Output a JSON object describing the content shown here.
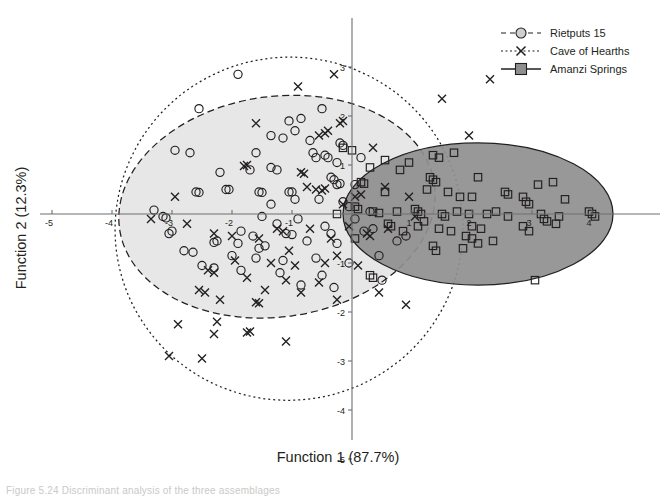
{
  "figure": {
    "type": "scatter",
    "background": "#ffffff"
  },
  "axes": {
    "xlabel": "Function 1 (87.7%)",
    "ylabel": "Function 2 (12.3%)",
    "xticks": [
      "-5",
      "-4",
      "-3",
      "-2",
      "-1",
      "1",
      "2",
      "3",
      "4"
    ],
    "yticks": [
      "3",
      "2",
      "1",
      "-1",
      "-2",
      "-3",
      "-4",
      "-5"
    ],
    "xlim": [
      -5.1,
      5.0
    ],
    "ylim": [
      -5.0,
      3.6
    ],
    "grid": false
  },
  "legend": {
    "position": "top-right",
    "items": [
      {
        "label": "Rietputs 15",
        "marker": "circle",
        "line": "dashed",
        "fill": "#cfcfcf"
      },
      {
        "label": "Cave of Hearths",
        "marker": "x",
        "line": "dotted",
        "fill": "none"
      },
      {
        "label": "Amanzi Springs",
        "marker": "square",
        "line": "solid",
        "fill": "#8f8f8f"
      }
    ]
  },
  "colors": {
    "ellipse_rietputs_fill": "#e3e3e3",
    "ellipse_hearths_fill": "#e3e3e3",
    "ellipse_amanzi_fill": "#8f8f8f",
    "stroke": "#231f20",
    "axis": "#6d6e71"
  },
  "chart_data": {
    "type": "scatter",
    "title": "",
    "xlabel": "Function 1 (87.7%)",
    "ylabel": "Function 2 (12.3%)",
    "xlim": [
      -5.1,
      5.0
    ],
    "ylim": [
      -5.0,
      3.6
    ],
    "grid": false,
    "legend_position": "top-right",
    "series": [
      {
        "name": "Rietputs 15",
        "marker": "circle",
        "line_style": "dashed",
        "ellipse": {
          "cx": -1.25,
          "cy": 0.15,
          "rx": 2.65,
          "ry": 2.25,
          "rotation": -8,
          "fill": "#e3e3e3",
          "stroke": "#231f20",
          "dash": "7,4"
        },
        "points": [
          [
            -1.9,
            2.85
          ],
          [
            -2.55,
            2.15
          ],
          [
            -1.05,
            1.9
          ],
          [
            -0.85,
            1.95
          ],
          [
            -1.35,
            1.6
          ],
          [
            -1.15,
            1.55
          ],
          [
            -0.7,
            1.5
          ],
          [
            -2.95,
            1.3
          ],
          [
            -2.7,
            1.25
          ],
          [
            -0.6,
            1.15
          ],
          [
            -1.6,
            1.25
          ],
          [
            -0.25,
            1.05
          ],
          [
            -0.35,
            0.75
          ],
          [
            -0.3,
            0.7
          ],
          [
            -0.25,
            0.6
          ],
          [
            -0.2,
            0.62
          ],
          [
            -1.0,
            0.45
          ],
          [
            -1.05,
            0.45
          ],
          [
            0.05,
            0.6
          ],
          [
            -2.6,
            0.45
          ],
          [
            -2.55,
            0.44
          ],
          [
            -2.1,
            0.5
          ],
          [
            -2.05,
            0.5
          ],
          [
            -1.55,
            0.45
          ],
          [
            -1.5,
            0.44
          ],
          [
            -0.95,
            0.3
          ],
          [
            -0.55,
            0.3
          ],
          [
            -1.35,
            0.2
          ],
          [
            -0.15,
            0.25
          ],
          [
            -3.3,
            0.08
          ],
          [
            -3.15,
            -0.05
          ],
          [
            -3.1,
            -0.08
          ],
          [
            -1.5,
            -0.05
          ],
          [
            -0.9,
            -0.1
          ],
          [
            -1.25,
            -0.2
          ],
          [
            -0.45,
            -0.25
          ],
          [
            -1.85,
            -0.35
          ],
          [
            -1.1,
            -0.4
          ],
          [
            -1.0,
            -0.42
          ],
          [
            -0.35,
            -0.4
          ],
          [
            -1.65,
            -0.45
          ],
          [
            0.2,
            -0.35
          ],
          [
            0.35,
            -0.3
          ],
          [
            -2.25,
            -0.55
          ],
          [
            -2.3,
            -0.58
          ],
          [
            -1.9,
            -0.6
          ],
          [
            -1.45,
            -0.65
          ],
          [
            -1.55,
            -0.7
          ],
          [
            -0.75,
            -0.55
          ],
          [
            -0.25,
            -0.6
          ],
          [
            -2.0,
            -0.85
          ],
          [
            -1.6,
            -0.9
          ],
          [
            -1.15,
            -0.95
          ],
          [
            -0.6,
            -0.9
          ],
          [
            -2.5,
            -1.05
          ],
          [
            -2.3,
            -1.1
          ],
          [
            -1.85,
            -1.15
          ],
          [
            -1.2,
            -1.2
          ],
          [
            -0.5,
            -1.25
          ],
          [
            -2.8,
            -0.75
          ],
          [
            -2.65,
            -0.78
          ],
          [
            -0.05,
            -1.0
          ],
          [
            0.45,
            -0.85
          ],
          [
            0.75,
            -0.55
          ],
          [
            0.9,
            -0.45
          ],
          [
            0.5,
            -1.35
          ],
          [
            -3.0,
            -0.35
          ],
          [
            -3.05,
            -0.4
          ],
          [
            -2.2,
            0.85
          ],
          [
            -1.7,
            0.9
          ],
          [
            -0.5,
            2.15
          ],
          [
            -0.65,
            1.25
          ],
          [
            -0.45,
            1.2
          ],
          [
            -0.4,
            1.15
          ],
          [
            -0.2,
            1.45
          ],
          [
            -0.15,
            1.4
          ],
          [
            0.15,
            1.15
          ],
          [
            0.05,
            -0.1
          ],
          [
            0.3,
            0.05
          ],
          [
            -0.85,
            -1.45
          ],
          [
            -0.3,
            -1.5
          ],
          [
            -1.35,
            0.95
          ],
          [
            -1.25,
            0.9
          ],
          [
            -0.95,
            1.7
          ],
          [
            -0.05,
            0.15
          ]
        ]
      },
      {
        "name": "Cave of Hearths",
        "marker": "x",
        "line_style": "dotted",
        "ellipse": {
          "cx": -1.05,
          "cy": -0.3,
          "rx": 2.9,
          "ry": 3.5,
          "rotation": -10,
          "fill": "none",
          "stroke": "#231f20",
          "dash": "2,3"
        },
        "points": [
          [
            -0.3,
            2.85
          ],
          [
            -0.15,
            1.9
          ],
          [
            -0.2,
            1.85
          ],
          [
            -0.4,
            1.7
          ],
          [
            -0.45,
            1.65
          ],
          [
            -0.55,
            1.6
          ],
          [
            -1.75,
            1.0
          ],
          [
            -1.8,
            0.98
          ],
          [
            -0.75,
            0.55
          ],
          [
            -0.6,
            0.5
          ],
          [
            -0.5,
            0.48
          ],
          [
            -0.45,
            0.52
          ],
          [
            -2.95,
            0.35
          ],
          [
            -3.35,
            -0.1
          ],
          [
            -1.25,
            -0.3
          ],
          [
            -1.15,
            -0.35
          ],
          [
            -0.7,
            -0.3
          ],
          [
            -0.05,
            -0.25
          ],
          [
            0.25,
            -0.4
          ],
          [
            0.3,
            -0.45
          ],
          [
            0.6,
            -0.3
          ],
          [
            -2.3,
            -0.4
          ],
          [
            -2.0,
            -0.45
          ],
          [
            -1.55,
            -0.5
          ],
          [
            -0.35,
            -0.5
          ],
          [
            -1.95,
            -0.95
          ],
          [
            -1.35,
            -1.0
          ],
          [
            -0.95,
            -1.05
          ],
          [
            -0.45,
            -1.0
          ],
          [
            0.1,
            -1.05
          ],
          [
            -2.4,
            -1.15
          ],
          [
            -2.3,
            -1.2
          ],
          [
            -1.75,
            -1.3
          ],
          [
            -1.1,
            -1.35
          ],
          [
            -0.55,
            -1.4
          ],
          [
            -1.45,
            -1.55
          ],
          [
            -0.85,
            -1.6
          ],
          [
            -2.55,
            -1.55
          ],
          [
            -2.45,
            -1.6
          ],
          [
            -2.2,
            -1.75
          ],
          [
            -1.6,
            -1.8
          ],
          [
            -1.55,
            -1.82
          ],
          [
            -0.25,
            -1.75
          ],
          [
            -2.9,
            -2.25
          ],
          [
            -2.25,
            -2.2
          ],
          [
            -2.3,
            -2.45
          ],
          [
            -1.7,
            -2.4
          ],
          [
            -1.75,
            -2.42
          ],
          [
            -1.1,
            -2.6
          ],
          [
            -3.05,
            -2.9
          ],
          [
            -2.5,
            -2.95
          ],
          [
            0.35,
            1.35
          ],
          [
            0.55,
            0.55
          ],
          [
            0.95,
            0.35
          ],
          [
            1.05,
            -0.05
          ],
          [
            1.5,
            2.35
          ],
          [
            2.3,
            2.75
          ],
          [
            1.95,
            1.6
          ],
          [
            0.45,
            -1.6
          ],
          [
            0.9,
            -1.85
          ],
          [
            -0.9,
            2.6
          ],
          [
            -1.6,
            1.85
          ],
          [
            -0.85,
            0.85
          ],
          [
            -0.8,
            0.82
          ],
          [
            -0.15,
            0.2
          ],
          [
            -2.75,
            -0.2
          ],
          [
            -1.05,
            -0.75
          ],
          [
            -0.25,
            -0.85
          ],
          [
            0.15,
            0.4
          ],
          [
            0.05,
            0.35
          ]
        ]
      },
      {
        "name": "Amanzi Springs",
        "marker": "square",
        "line_style": "solid",
        "ellipse": {
          "cx": 2.1,
          "cy": 0.0,
          "rx": 2.25,
          "ry": 1.45,
          "rotation": 0,
          "fill": "#8f8f8f",
          "stroke": "#231f20",
          "dash": "none"
        },
        "points": [
          [
            0.55,
            1.1
          ],
          [
            0.95,
            1.05
          ],
          [
            0.3,
            0.95
          ],
          [
            0.8,
            0.9
          ],
          [
            1.35,
            1.2
          ],
          [
            1.45,
            1.15
          ],
          [
            1.7,
            1.25
          ],
          [
            0.15,
            0.65
          ],
          [
            0.2,
            0.62
          ],
          [
            1.3,
            0.75
          ],
          [
            1.35,
            0.7
          ],
          [
            1.4,
            0.65
          ],
          [
            2.1,
            0.75
          ],
          [
            0.55,
            0.45
          ],
          [
            1.25,
            0.5
          ],
          [
            1.8,
            0.35
          ],
          [
            2.0,
            0.35
          ],
          [
            3.1,
            0.6
          ],
          [
            3.35,
            0.65
          ],
          [
            2.85,
            0.35
          ],
          [
            3.55,
            0.3
          ],
          [
            2.9,
            0.25
          ],
          [
            2.95,
            0.2
          ],
          [
            0.05,
            0.15
          ],
          [
            0.1,
            0.1
          ],
          [
            0.35,
            0.05
          ],
          [
            0.45,
            0.02
          ],
          [
            0.75,
            0.05
          ],
          [
            1.05,
            0.1
          ],
          [
            1.1,
            0.05
          ],
          [
            1.15,
            0.0
          ],
          [
            1.2,
            -0.15
          ],
          [
            1.5,
            0.0
          ],
          [
            1.55,
            -0.05
          ],
          [
            1.75,
            0.05
          ],
          [
            1.95,
            0.0
          ],
          [
            2.25,
            0.0
          ],
          [
            2.4,
            0.05
          ],
          [
            2.6,
            -0.05
          ],
          [
            3.15,
            0.0
          ],
          [
            3.2,
            -0.1
          ],
          [
            3.25,
            -0.15
          ],
          [
            3.45,
            -0.05
          ],
          [
            3.95,
            0.05
          ],
          [
            4.0,
            0.0
          ],
          [
            4.05,
            -0.05
          ],
          [
            0.6,
            -0.2
          ],
          [
            0.65,
            -0.25
          ],
          [
            1.1,
            -0.25
          ],
          [
            1.45,
            -0.3
          ],
          [
            2.0,
            -0.25
          ],
          [
            2.15,
            -0.3
          ],
          [
            2.85,
            -0.25
          ],
          [
            2.95,
            -0.35
          ],
          [
            3.4,
            -0.2
          ],
          [
            1.9,
            -0.45
          ],
          [
            2.0,
            -0.5
          ],
          [
            2.35,
            -0.55
          ],
          [
            0.05,
            -0.5
          ],
          [
            1.35,
            -0.65
          ],
          [
            1.4,
            -0.75
          ],
          [
            1.85,
            -0.7
          ],
          [
            2.1,
            -0.6
          ],
          [
            0.3,
            -1.25
          ],
          [
            0.35,
            -1.3
          ],
          [
            3.05,
            -1.35
          ],
          [
            -0.25,
            0.0
          ],
          [
            -0.15,
            1.35
          ],
          [
            0.0,
            1.3
          ],
          [
            2.55,
            0.45
          ],
          [
            2.6,
            0.4
          ],
          [
            1.6,
            0.45
          ],
          [
            0.85,
            -0.35
          ],
          [
            1.65,
            -0.35
          ]
        ]
      }
    ]
  },
  "caption": {
    "text": "Figure 5.24 Discriminant analysis of the three assemblages"
  }
}
